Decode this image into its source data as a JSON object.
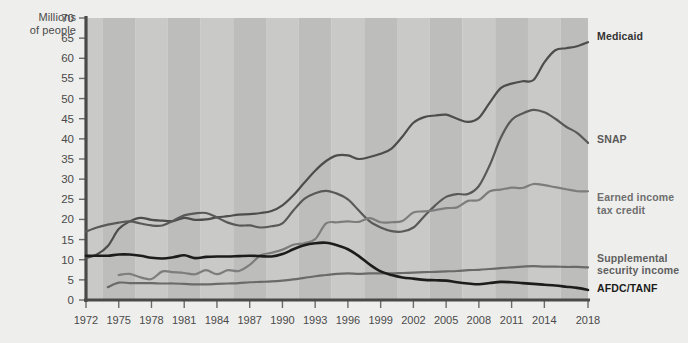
{
  "chart_data": {
    "type": "line",
    "title": "",
    "ylabel": "Millions\nof people",
    "xlabel": "",
    "ylim": [
      0,
      70
    ],
    "ytick_step": 5,
    "yticks": [
      0,
      5,
      10,
      15,
      20,
      25,
      30,
      35,
      40,
      45,
      50,
      55,
      60,
      65,
      70
    ],
    "xlim": [
      1972,
      2018
    ],
    "xticks": [
      1972,
      1975,
      1978,
      1981,
      1984,
      1987,
      1990,
      1993,
      1996,
      1999,
      2002,
      2005,
      2008,
      2011,
      2014,
      2018
    ],
    "grid": false,
    "legend_position": "right-inline",
    "background_bands": "alternating vertical 3-year stripes",
    "x": [
      1972,
      1973,
      1974,
      1975,
      1976,
      1977,
      1978,
      1979,
      1980,
      1981,
      1982,
      1983,
      1984,
      1985,
      1986,
      1987,
      1988,
      1989,
      1990,
      1991,
      1992,
      1993,
      1994,
      1995,
      1996,
      1997,
      1998,
      1999,
      2000,
      2001,
      2002,
      2003,
      2004,
      2005,
      2006,
      2007,
      2008,
      2009,
      2010,
      2011,
      2012,
      2013,
      2014,
      2015,
      2016,
      2017,
      2018
    ],
    "series": [
      {
        "name": "Medicaid",
        "color": "#4d4d4d",
        "label_color": "#333333",
        "label_y_value": 65.5,
        "values": [
          10.4,
          11.3,
          13.4,
          17.6,
          19.5,
          20.4,
          19.9,
          19.7,
          19.6,
          20.4,
          19.9,
          20.0,
          20.5,
          20.8,
          21.2,
          21.3,
          21.6,
          22.1,
          23.5,
          26.0,
          29.1,
          32.1,
          34.5,
          35.9,
          35.9,
          35.0,
          35.5,
          36.3,
          37.6,
          40.6,
          44.0,
          45.4,
          45.8,
          46.0,
          45.0,
          44.2,
          45.2,
          49.0,
          52.6,
          53.7,
          54.3,
          54.6,
          59.0,
          62.0,
          62.5,
          63.0,
          64.0
        ]
      },
      {
        "name": "SNAP",
        "color": "#595959",
        "label_color": "#5a5a5a",
        "label_y_value": 40.0,
        "values": [
          17.0,
          18.0,
          18.7,
          19.2,
          19.5,
          19.0,
          18.5,
          18.5,
          19.7,
          21.0,
          21.5,
          21.6,
          20.5,
          19.2,
          18.5,
          18.5,
          18.0,
          18.3,
          19.0,
          22.2,
          25.1,
          26.5,
          27.1,
          26.4,
          25.0,
          22.2,
          19.5,
          18.0,
          17.1,
          17.0,
          18.0,
          20.8,
          23.5,
          25.6,
          26.3,
          26.3,
          28.3,
          33.5,
          40.2,
          44.7,
          46.3,
          47.2,
          46.6,
          45.0,
          43.0,
          41.5,
          39.0
        ]
      },
      {
        "name": "Earned income\ntax credit",
        "color": "#7d7d7d",
        "label_color": "#6f6f6f",
        "label_y_value": 25.5,
        "values": [
          0,
          0,
          0,
          6.2,
          6.5,
          5.6,
          5.2,
          7.1,
          6.9,
          6.7,
          6.4,
          7.4,
          6.4,
          7.4,
          7.2,
          8.7,
          11.1,
          11.7,
          12.5,
          13.7,
          14.1,
          15.1,
          19.0,
          19.3,
          19.5,
          19.4,
          20.3,
          19.3,
          19.3,
          19.6,
          21.7,
          22.0,
          22.3,
          22.8,
          23.0,
          24.6,
          24.8,
          27.0,
          27.4,
          27.9,
          27.8,
          28.8,
          28.5,
          28.0,
          27.5,
          27.0,
          27.0
        ]
      },
      {
        "name": "Supplemental\nsecurity income",
        "color": "#6a6a6a",
        "label_color": "#5f5f5f",
        "label_y_value": 10.5,
        "values": [
          0,
          0,
          3.2,
          4.3,
          4.2,
          4.2,
          4.2,
          4.1,
          4.1,
          4.0,
          3.9,
          3.9,
          4.0,
          4.1,
          4.2,
          4.4,
          4.5,
          4.6,
          4.8,
          5.1,
          5.5,
          5.9,
          6.2,
          6.5,
          6.6,
          6.5,
          6.6,
          6.6,
          6.6,
          6.7,
          6.8,
          6.9,
          7.0,
          7.1,
          7.2,
          7.4,
          7.5,
          7.7,
          7.9,
          8.1,
          8.3,
          8.4,
          8.3,
          8.3,
          8.2,
          8.2,
          8.1
        ]
      },
      {
        "name": "AFDC/TANF",
        "color": "#1c1c1c",
        "label_color": "#1c1c1c",
        "label_y_value": 3.0,
        "values": [
          11.0,
          11.0,
          11.0,
          11.3,
          11.3,
          11.0,
          10.5,
          10.3,
          10.6,
          11.1,
          10.4,
          10.7,
          10.8,
          10.8,
          10.9,
          11.0,
          10.9,
          10.8,
          11.4,
          12.6,
          13.6,
          14.1,
          14.2,
          13.6,
          12.6,
          10.9,
          8.8,
          7.1,
          6.2,
          5.6,
          5.3,
          5.0,
          4.9,
          4.8,
          4.4,
          4.1,
          3.9,
          4.2,
          4.5,
          4.4,
          4.2,
          4.0,
          3.8,
          3.6,
          3.3,
          3.0,
          2.5
        ]
      }
    ]
  }
}
